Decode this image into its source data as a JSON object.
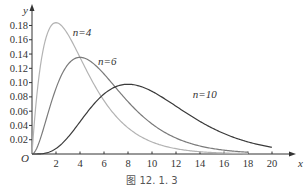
{
  "chart_data": {
    "type": "line",
    "title": "",
    "caption": "图 12. 1. 3",
    "xlabel": "x",
    "ylabel": "y",
    "origin_label": "O",
    "xlim": [
      0,
      21
    ],
    "ylim": [
      0,
      0.19
    ],
    "grid": false,
    "x_ticks": [
      2,
      4,
      6,
      8,
      10,
      12,
      14,
      16,
      18,
      20
    ],
    "x_tick_labels": [
      "2",
      "4",
      "6",
      "8",
      "10",
      "12",
      "14",
      "16",
      "18",
      "20"
    ],
    "y_ticks": [
      0.02,
      0.04,
      0.06,
      0.08,
      0.1,
      0.12,
      0.14,
      0.16,
      0.18
    ],
    "y_tick_labels": [
      "0.02",
      "0.04",
      "0.06",
      "0.08",
      "0.10",
      "0.12",
      "0.14",
      "0.16",
      "0.18"
    ],
    "series": [
      {
        "name": "n=4",
        "label": "n=4",
        "distribution": "chi-square",
        "df": 4,
        "color": "#b3b3b3",
        "x_range": [
          0,
          18
        ],
        "label_at": [
          3.4,
          0.165
        ],
        "peak": [
          2,
          0.184
        ]
      },
      {
        "name": "n=6",
        "label": "n=6",
        "distribution": "chi-square",
        "df": 6,
        "color": "#7a7a7a",
        "x_range": [
          0,
          18
        ],
        "label_at": [
          5.5,
          0.125
        ],
        "peak": [
          4,
          0.135
        ]
      },
      {
        "name": "n=10",
        "label": "n=10",
        "distribution": "chi-square",
        "df": 10,
        "color": "#3a3a3a",
        "x_range": [
          0,
          20
        ],
        "label_at": [
          13.4,
          0.078
        ],
        "peak": [
          8,
          0.0977
        ]
      }
    ]
  }
}
